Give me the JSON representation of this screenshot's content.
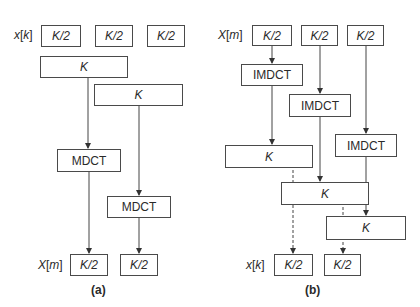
{
  "panel_a": {
    "caption": "(a)",
    "input_label": {
      "var": "x",
      "index": "k"
    },
    "output_label": {
      "var": "X",
      "index": "m"
    },
    "input_blocks": [
      "K/2",
      "K/2",
      "K/2"
    ],
    "windows": [
      "K",
      "K"
    ],
    "transforms": [
      "MDCT",
      "MDCT"
    ],
    "output_blocks": [
      "K/2",
      "K/2"
    ]
  },
  "panel_b": {
    "caption": "(b)",
    "input_label": {
      "var": "X",
      "index": "m"
    },
    "output_label": {
      "var": "x",
      "index": "k"
    },
    "input_blocks": [
      "K/2",
      "K/2",
      "K/2"
    ],
    "transforms": [
      "IMDCT",
      "IMDCT",
      "IMDCT"
    ],
    "windows": [
      "K",
      "K",
      "K"
    ],
    "output_blocks": [
      "K/2",
      "K/2"
    ]
  },
  "colors": {
    "stroke": "#4a4a4a",
    "text": "#2a2a2a",
    "background": "#ffffff"
  }
}
